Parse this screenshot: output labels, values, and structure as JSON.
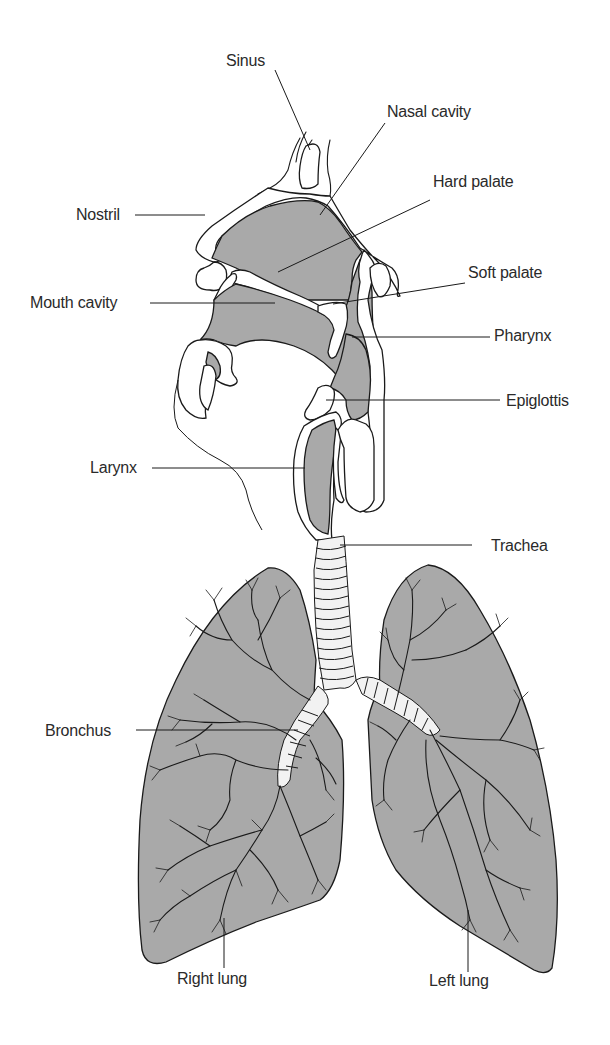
{
  "diagram": {
    "labels": {
      "sinus": "Sinus",
      "nasal_cavity": "Nasal cavity",
      "hard_palate": "Hard palate",
      "nostril": "Nostril",
      "soft_palate": "Soft palate",
      "mouth_cavity": "Mouth cavity",
      "pharynx": "Pharynx",
      "epiglottis": "Epiglottis",
      "larynx": "Larynx",
      "trachea": "Trachea",
      "bronchus": "Bronchus",
      "right_lung": "Right lung",
      "left_lung": "Left lung"
    },
    "colors": {
      "fill_gray": "#a9a9a9",
      "outline": "#1a1a1a",
      "background": "#ffffff"
    }
  }
}
